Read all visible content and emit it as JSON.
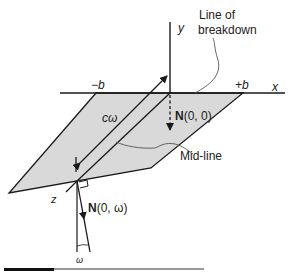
{
  "diagram": {
    "type": "geometry-schematic",
    "axes": {
      "x_label": "x",
      "y_label": "y",
      "z_label": "z"
    },
    "bounds": {
      "left": "−b",
      "right": "+b"
    },
    "annotations": {
      "line_of_breakdown_1": "Line of",
      "line_of_breakdown_2": "breakdown",
      "mid_line": "Mid-line",
      "length": "cω"
    },
    "normals": {
      "origin_bold": "N",
      "origin_args": "(0, 0)",
      "tip_bold": "N",
      "tip_args": "(0, ω)"
    },
    "angle_label": "ω",
    "colors": {
      "plate_fill": "#d9d9d9",
      "line": "#1a1a1a",
      "leader": "#555555"
    }
  }
}
